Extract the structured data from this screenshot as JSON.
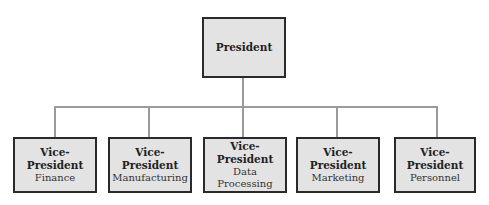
{
  "chart": {
    "root": {
      "title": "President"
    },
    "children": [
      {
        "title": "Vice-President",
        "subtitle": [
          "Finance"
        ]
      },
      {
        "title": "Vice-President",
        "subtitle": [
          "Manufacturing"
        ]
      },
      {
        "title": "Vice-President",
        "subtitle": [
          "Data",
          "Processing"
        ]
      },
      {
        "title": "Vice-President",
        "subtitle": [
          "Marketing"
        ]
      },
      {
        "title": "Vice-President",
        "subtitle": [
          "Personnel"
        ]
      }
    ]
  }
}
